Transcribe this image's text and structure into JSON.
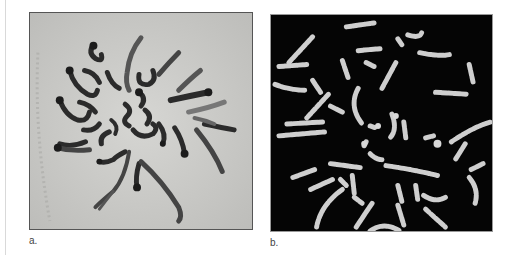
{
  "figure": {
    "panels": [
      {
        "id": "a",
        "label": "a.",
        "description": "Light micrograph of metaphase chromosome spread (dark chromosomes on pale grey background)",
        "background_color": "#c9c9c6",
        "chromosome_color": "#2a2a2a"
      },
      {
        "id": "b",
        "label": "b.",
        "description": "Banded metaphase chromosome spread (light banded chromosomes on black background)",
        "background_color": "#050505",
        "chromosome_color": "#d8d8d8"
      }
    ]
  }
}
